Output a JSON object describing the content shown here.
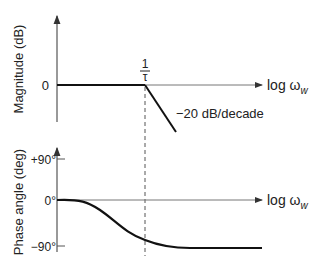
{
  "magnitude_plot": {
    "y_label": "Magnitude (dB)",
    "zero_tick": "0",
    "x_label_main": "log ω",
    "x_label_sub": "w",
    "break_label_num": "1",
    "break_label_den": "τ",
    "slope_annotation": "−20 dB/decade"
  },
  "phase_plot": {
    "y_label": "Phase angle (deg)",
    "ticks": [
      "+90°",
      "0°",
      "−90°"
    ],
    "x_label_main": "log ω",
    "x_label_sub": "w"
  },
  "colors": {
    "line": "#111111",
    "axis": "#555555",
    "text": "#222222"
  }
}
